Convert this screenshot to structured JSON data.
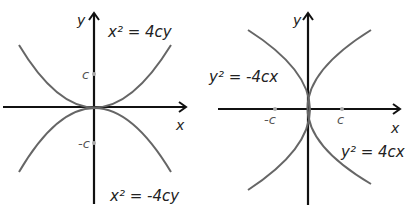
{
  "diagrams": [
    {
      "name": "vertical-parabolas",
      "axis_labels": {
        "x": "x",
        "y": "y"
      },
      "ticks": {
        "pos": "c",
        "neg": "-c"
      },
      "equations": {
        "top": "x² = 4cy",
        "bottom": "x² = -4cy"
      }
    },
    {
      "name": "horizontal-parabolas",
      "axis_labels": {
        "x": "x",
        "y": "y"
      },
      "ticks": {
        "pos": "c",
        "neg": "-c"
      },
      "equations": {
        "left": "y² = -4cx",
        "right": "y² = 4cx"
      }
    }
  ],
  "colors": {
    "axis": "#111111",
    "curve": "#666666",
    "tick": "#aaaaaa"
  }
}
